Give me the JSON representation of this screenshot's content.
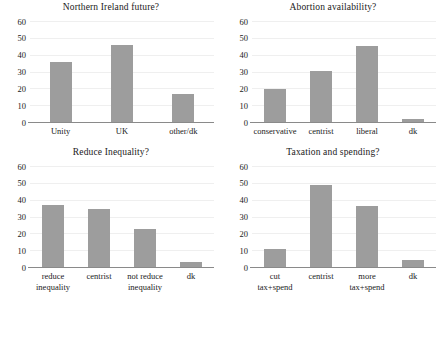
{
  "figure": {
    "background": "#ffffff",
    "bar_color": "#9d9d9d",
    "grid_color": "#efefef",
    "axis_color": "#8a8a8a"
  },
  "chart_data": [
    {
      "type": "bar",
      "title": "Northern Ireland future?",
      "categories": [
        "Unity",
        "UK",
        "other/dk"
      ],
      "values": [
        36.5,
        46.5,
        17
      ],
      "xlabel": "",
      "ylabel": "",
      "ylim": [
        0,
        60
      ],
      "yticks": [
        0,
        10,
        20,
        30,
        40,
        50,
        60
      ],
      "grid": true,
      "legend": "none"
    },
    {
      "type": "bar",
      "title": "Abortion availability?",
      "categories": [
        "conservative",
        "centrist",
        "liberal",
        "dk"
      ],
      "values": [
        20.5,
        31,
        46,
        2.5
      ],
      "xlabel": "",
      "ylabel": "",
      "ylim": [
        0,
        60
      ],
      "yticks": [
        0,
        10,
        20,
        30,
        40,
        50,
        60
      ],
      "grid": true,
      "legend": "none"
    },
    {
      "type": "bar",
      "title": "Reduce Inequality?",
      "categories": [
        "reduce inequality",
        "centrist",
        "not reduce inequality",
        "dk"
      ],
      "category_lines": [
        [
          "reduce",
          "inequality"
        ],
        [
          "centrist",
          ""
        ],
        [
          "not reduce",
          "inequality"
        ],
        [
          "dk",
          ""
        ]
      ],
      "values": [
        37.5,
        35,
        23,
        3.5
      ],
      "xlabel": "",
      "ylabel": "",
      "ylim": [
        0,
        60
      ],
      "yticks": [
        0,
        10,
        20,
        30,
        40,
        50,
        60
      ],
      "grid": true,
      "legend": "none"
    },
    {
      "type": "bar",
      "title": "Taxation and spending?",
      "categories": [
        "cut tax+spend",
        "centrist",
        "more tax+spend",
        "dk"
      ],
      "values": [
        11,
        49.5,
        37,
        4.5
      ],
      "xlabel": "",
      "ylabel": "",
      "ylim": [
        0,
        60
      ],
      "yticks": [
        0,
        10,
        20,
        30,
        40,
        50,
        60
      ],
      "grid": true,
      "legend": "none"
    }
  ]
}
